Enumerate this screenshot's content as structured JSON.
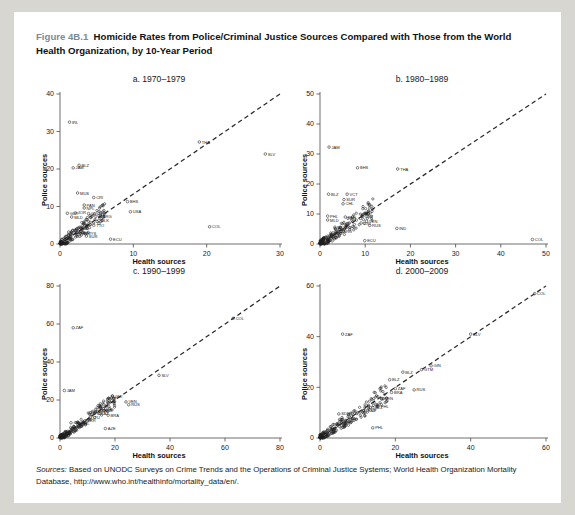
{
  "figure": {
    "number": "Figure 4B.1",
    "title": "Homicide Rates from Police/Criminal Justice Sources Compared with Those from the World Health Organization, by 10-Year Period"
  },
  "sources_note": {
    "label": "Sources:",
    "text": "Based on UNODC Surveys on Crime Trends and the Operations of Criminal Justice Systems; World Health Organization Mortality Database, http://www.who.int/healthinfo/mortality_data/en/."
  },
  "chart_data": [
    {
      "type": "scatter",
      "title": "a. 1970–1979",
      "xlabel": "Health sources",
      "ylabel": "Police sources",
      "xlim": [
        0,
        30
      ],
      "ylim": [
        0,
        40
      ],
      "xticks": [
        0,
        10,
        20,
        30
      ],
      "yticks": [
        0,
        10,
        20,
        30,
        40
      ],
      "grid": false,
      "reference_line": {
        "type": "identity",
        "style": "dashed",
        "from": [
          0,
          0
        ],
        "to": [
          30,
          40
        ]
      },
      "labeled_points": [
        {
          "label": "IRL",
          "x": 1.3,
          "y": 32.5
        },
        {
          "label": "BLZ",
          "x": 2.6,
          "y": 21.0
        },
        {
          "label": "JAM",
          "x": 1.8,
          "y": 20.3
        },
        {
          "label": "MUS",
          "x": 2.4,
          "y": 13.6
        },
        {
          "label": "CRI",
          "x": 4.6,
          "y": 12.4
        },
        {
          "label": "PAN",
          "x": 3.3,
          "y": 10.4
        },
        {
          "label": "NPL",
          "x": 3.3,
          "y": 9.6
        },
        {
          "label": "GUY",
          "x": 1.0,
          "y": 8.2
        },
        {
          "label": "JOR",
          "x": 2.1,
          "y": 8.3
        },
        {
          "label": "COL",
          "x": 3.9,
          "y": 8.1
        },
        {
          "label": "MLD",
          "x": 1.6,
          "y": 7.2
        },
        {
          "label": "ARG",
          "x": 5.5,
          "y": 7.4
        },
        {
          "label": "SLK",
          "x": 5.3,
          "y": 6.3
        },
        {
          "label": "TTO",
          "x": 4.6,
          "y": 5.0
        },
        {
          "label": "BHS",
          "x": 9.2,
          "y": 11.3
        },
        {
          "label": "USA",
          "x": 9.6,
          "y": 8.6
        },
        {
          "label": "THA",
          "x": 19.0,
          "y": 27.2
        },
        {
          "label": "SLV",
          "x": 28.0,
          "y": 24.0
        },
        {
          "label": "COL",
          "x": 20.4,
          "y": 4.6
        },
        {
          "label": "ECU",
          "x": 6.9,
          "y": 1.3
        },
        {
          "label": "BRB",
          "x": 2.4,
          "y": 4.1
        },
        {
          "label": "SUR",
          "x": 3.6,
          "y": 2.1
        },
        {
          "label": "MYS",
          "x": 3.4,
          "y": 2.9
        },
        {
          "label": "LTU",
          "x": 1.2,
          "y": 3.2
        }
      ],
      "cluster_note": "Dense cloud of ~150 unlabeled country points concentrated between x 0–6 and y 0–6"
    },
    {
      "type": "scatter",
      "title": "b. 1980–1989",
      "xlabel": "Health sources",
      "ylabel": "Police sources",
      "xlim": [
        0,
        50
      ],
      "ylim": [
        0,
        50
      ],
      "xticks": [
        0,
        10,
        20,
        30,
        40,
        50
      ],
      "yticks": [
        0,
        10,
        20,
        30,
        40,
        50
      ],
      "grid": false,
      "reference_line": {
        "type": "identity",
        "style": "dashed",
        "from": [
          0,
          0
        ],
        "to": [
          50,
          50
        ]
      },
      "labeled_points": [
        {
          "label": "JAM",
          "x": 2.0,
          "y": 32.3
        },
        {
          "label": "BHS",
          "x": 8.3,
          "y": 25.4
        },
        {
          "label": "THA",
          "x": 17.2,
          "y": 25.0
        },
        {
          "label": "BLZ",
          "x": 1.9,
          "y": 16.6
        },
        {
          "label": "VCT",
          "x": 6.0,
          "y": 16.6
        },
        {
          "label": "SUR",
          "x": 5.3,
          "y": 14.8
        },
        {
          "label": "CHL",
          "x": 5.1,
          "y": 13.4
        },
        {
          "label": "PHL",
          "x": 1.7,
          "y": 9.3
        },
        {
          "label": "PAN",
          "x": 5.6,
          "y": 9.0
        },
        {
          "label": "LBY",
          "x": 9.5,
          "y": 9.3
        },
        {
          "label": "MLD",
          "x": 1.7,
          "y": 8.0
        },
        {
          "label": "VEN",
          "x": 10.3,
          "y": 7.6
        },
        {
          "label": "CRI",
          "x": 9.1,
          "y": 7.0
        },
        {
          "label": "RUS",
          "x": 11.0,
          "y": 6.2
        },
        {
          "label": "IND",
          "x": 17.0,
          "y": 5.2
        },
        {
          "label": "ECU",
          "x": 9.9,
          "y": 1.1
        },
        {
          "label": "COL",
          "x": 47.0,
          "y": 1.5
        },
        {
          "label": "MUS",
          "x": 3.3,
          "y": 5.6
        },
        {
          "label": "ARG",
          "x": 4.6,
          "y": 4.2
        }
      ],
      "cluster_note": "Dense cloud of ~170 unlabeled country points concentrated between x 0–12 and y 0–8"
    },
    {
      "type": "scatter",
      "title": "c. 1990–1999",
      "xlabel": "Health sources",
      "ylabel": "Police sources",
      "xlim": [
        0,
        80
      ],
      "ylim": [
        0,
        80
      ],
      "xticks": [
        0,
        20,
        40,
        60,
        80
      ],
      "yticks": [
        0,
        20,
        40,
        60,
        80
      ],
      "grid": false,
      "reference_line": {
        "type": "identity",
        "style": "dashed",
        "from": [
          0,
          0
        ],
        "to": [
          80,
          80
        ]
      },
      "labeled_points": [
        {
          "label": "COL",
          "x": 63.0,
          "y": 63.0
        },
        {
          "label": "ZAF",
          "x": 4.8,
          "y": 58.0
        },
        {
          "label": "SLV",
          "x": 36.0,
          "y": 33.0
        },
        {
          "label": "JAM",
          "x": 1.6,
          "y": 25.0
        },
        {
          "label": "GMI",
          "x": 19.0,
          "y": 22.0
        },
        {
          "label": "VEN",
          "x": 24.0,
          "y": 19.0
        },
        {
          "label": "RUS",
          "x": 25.0,
          "y": 17.5
        },
        {
          "label": "BLZ",
          "x": 15.0,
          "y": 14.5
        },
        {
          "label": "BRA",
          "x": 17.5,
          "y": 12.0
        },
        {
          "label": "KAZ",
          "x": 14.0,
          "y": 13.0
        },
        {
          "label": "EST",
          "x": 13.0,
          "y": 14.0
        },
        {
          "label": "GEO",
          "x": 4.0,
          "y": 8.0
        },
        {
          "label": "UKR",
          "x": 9.0,
          "y": 9.0
        },
        {
          "label": "AZE",
          "x": 16.5,
          "y": 5.0
        },
        {
          "label": "PHL",
          "x": 7.0,
          "y": 7.5
        },
        {
          "label": "LTU",
          "x": 11.0,
          "y": 11.0
        }
      ],
      "cluster_note": "Dense elongated cloud of ~180 unlabeled points along the identity line from x 0–20"
    },
    {
      "type": "scatter",
      "title": "d. 2000–2009",
      "xlabel": "Health sources",
      "ylabel": "Police sources",
      "xlim": [
        0,
        60
      ],
      "ylim": [
        0,
        60
      ],
      "xticks": [
        0,
        20,
        40,
        60
      ],
      "yticks": [
        0,
        20,
        40,
        60
      ],
      "grid": false,
      "reference_line": {
        "type": "identity",
        "style": "dashed",
        "from": [
          0,
          0
        ],
        "to": [
          60,
          60
        ]
      },
      "labeled_points": [
        {
          "label": "COL",
          "x": 57.0,
          "y": 57.0
        },
        {
          "label": "ZAF",
          "x": 6.0,
          "y": 41.0
        },
        {
          "label": "SLV",
          "x": 40.0,
          "y": 41.0
        },
        {
          "label": "GIN",
          "x": 29.5,
          "y": 28.5
        },
        {
          "label": "BLZ",
          "x": 22.0,
          "y": 26.0
        },
        {
          "label": "GTM",
          "x": 27.0,
          "y": 27.0
        },
        {
          "label": "BLZ",
          "x": 18.5,
          "y": 23.0
        },
        {
          "label": "RUS",
          "x": 25.0,
          "y": 19.0
        },
        {
          "label": "ZAF",
          "x": 20.0,
          "y": 19.5
        },
        {
          "label": "BRA",
          "x": 19.0,
          "y": 18.0
        },
        {
          "label": "VEN",
          "x": 16.5,
          "y": 15.5
        },
        {
          "label": "PHL",
          "x": 15.5,
          "y": 12.5
        },
        {
          "label": "BLZ",
          "x": 14.0,
          "y": 12.0
        },
        {
          "label": "SDN",
          "x": 5.0,
          "y": 9.5
        },
        {
          "label": "PHL",
          "x": 14.0,
          "y": 4.0
        },
        {
          "label": "KAZ",
          "x": 12.0,
          "y": 11.0
        }
      ],
      "cluster_note": "Dense elongated cloud of ~190 unlabeled points along the identity line from x 0–18"
    }
  ],
  "style": {
    "page_background": "#ffffff",
    "canvas_background": "#d8d6d1",
    "figure_number_color": "#7a8b96",
    "text_color": "#1a1a1a",
    "marker_color": "#1d1d1d",
    "reference_line_color": "#2b2b2b"
  }
}
